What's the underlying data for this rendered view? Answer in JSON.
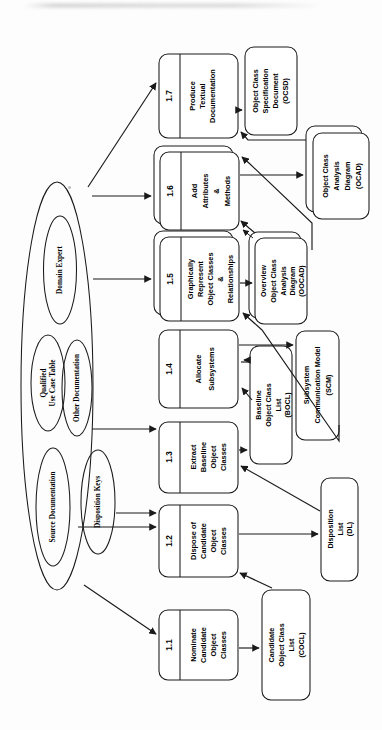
{
  "diagram": {
    "orientation": "rotated-90-ccw",
    "ink_color": "#1a1a1a",
    "paper_color": "#fdfdfd"
  },
  "processes": [
    {
      "id": "p11",
      "number": "1.1",
      "lines": [
        "Nominate",
        "Candidate",
        "Object",
        "Classes"
      ],
      "stacked": false
    },
    {
      "id": "p12",
      "number": "1.2",
      "lines": [
        "Dispose of",
        "Candidate",
        "Object",
        "Classes"
      ],
      "stacked": false
    },
    {
      "id": "p13",
      "number": "1.3",
      "lines": [
        "Extract",
        "Baseline",
        "Object",
        "Classes"
      ],
      "stacked": false
    },
    {
      "id": "p14",
      "number": "1.4",
      "lines": [
        "Allocate",
        "Subsystems"
      ],
      "stacked": false
    },
    {
      "id": "p15",
      "number": "1.5",
      "lines": [
        "Graphically",
        "Represent",
        "Object Classes",
        "&",
        "Relationships"
      ],
      "stacked": true
    },
    {
      "id": "p16",
      "number": "1.6",
      "lines": [
        "Add",
        "Attributes",
        "&",
        "Methods"
      ],
      "stacked": true
    },
    {
      "id": "p17",
      "number": "1.7",
      "lines": [
        "Produce",
        "Textual",
        "Documentation"
      ],
      "stacked": false
    }
  ],
  "stores": [
    {
      "id": "cocl",
      "lines": [
        "Candidate",
        "Object Class",
        "List",
        "(COCL)"
      ],
      "stacked": false
    },
    {
      "id": "dl",
      "lines": [
        "Disposition",
        "List",
        "(DL)"
      ],
      "stacked": false
    },
    {
      "id": "bocl",
      "lines": [
        "Baseline",
        "Object Class",
        "List",
        "(BOCL)"
      ],
      "stacked": false
    },
    {
      "id": "scm",
      "lines": [
        "Subsystem",
        "Communication Model",
        "(SCM)"
      ],
      "stacked": false
    },
    {
      "id": "oocad",
      "lines": [
        "Overview",
        "Object Class",
        "Analysis",
        "Diagram",
        "(OOCAD)"
      ],
      "stacked": true
    },
    {
      "id": "ocad",
      "lines": [
        "Object Class",
        "Analysis",
        "Diagram",
        "(OCAD)"
      ],
      "stacked": true
    },
    {
      "id": "ocsd",
      "lines": [
        "Object Class",
        "Specification",
        "Document",
        "(OCSD)"
      ],
      "stacked": false
    }
  ],
  "entities": [
    {
      "id": "outer",
      "label": ""
    },
    {
      "id": "domain",
      "label": "Domain Expert"
    },
    {
      "id": "quct",
      "lines": [
        "Qualified",
        "Use Case Table"
      ]
    },
    {
      "id": "otherdoc",
      "label": "Other Documentation"
    },
    {
      "id": "srcdoc",
      "label": "Source Documentation"
    },
    {
      "id": "dispkeys",
      "label": "Disposition Keys"
    }
  ]
}
